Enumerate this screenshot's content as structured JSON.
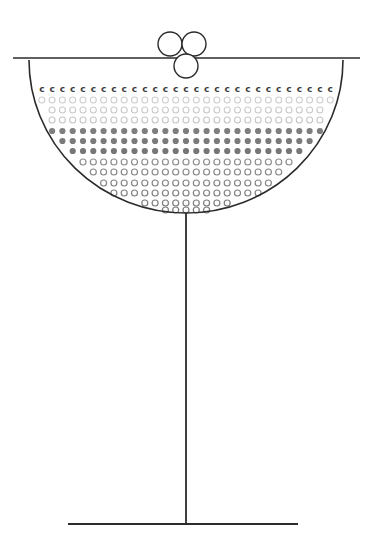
{
  "illustration": {
    "title": "Coupe Glass with Effervescence",
    "subject": "champagne-coupe-glass",
    "style": "line-art",
    "background_color": "#ffffff",
    "stroke_color": "#2b2b2b",
    "canvas": {
      "width": 372,
      "height": 548
    }
  },
  "geometry": {
    "rim": {
      "x1": 13,
      "y1": 58,
      "x2": 360,
      "y2": 58,
      "stroke_width": 1.4
    },
    "bowl": {
      "left_x": 29,
      "right_x": 343,
      "top_y": 60,
      "bottom_y": 213,
      "center_x": 186,
      "radius_x": 157,
      "radius_y": 153,
      "stroke_width": 1.6
    },
    "stem": {
      "x": 186,
      "y_top": 213,
      "y_bottom": 524,
      "stroke_width": 1.8
    },
    "base": {
      "x1": 68,
      "y1": 524,
      "x2": 298,
      "y2": 524,
      "stroke_width": 1.8
    }
  },
  "bubbles_large": {
    "label": "rising-bubble-cluster",
    "radius": 12,
    "stroke_color": "#2b2b2b",
    "stroke_width": 1.4,
    "items": [
      {
        "cx": 170,
        "cy": 44,
        "name": "bubble-top-left"
      },
      {
        "cx": 194,
        "cy": 44,
        "name": "bubble-top-right"
      },
      {
        "cx": 186,
        "cy": 66,
        "name": "bubble-lower-center"
      }
    ]
  },
  "fizz_rows": {
    "column_spacing": 10.3,
    "column_origin_x": 33,
    "column_count": 30,
    "rows": [
      {
        "y": 89,
        "kind": "glyph",
        "glyph": "c",
        "color": "#3c3c3c",
        "size": 9,
        "label": "crescent-row"
      },
      {
        "y": 100,
        "kind": "ring",
        "color": "#cfcfcf",
        "r": 3.0,
        "stroke_width": 1.1,
        "label": "pale-ring-row-1"
      },
      {
        "y": 110,
        "kind": "ring",
        "color": "#cbcbcb",
        "r": 3.0,
        "stroke_width": 1.1,
        "label": "pale-ring-row-2"
      },
      {
        "y": 120,
        "kind": "ring",
        "color": "#c6c6c6",
        "r": 3.0,
        "stroke_width": 1.1,
        "label": "pale-ring-row-3"
      },
      {
        "y": 131,
        "kind": "dot",
        "color": "#7e7e7e",
        "r": 3.1,
        "label": "dark-dot-row-1"
      },
      {
        "y": 141,
        "kind": "dot",
        "color": "#7a7a7a",
        "r": 3.1,
        "label": "dark-dot-row-2"
      },
      {
        "y": 151,
        "kind": "dot",
        "color": "#767676",
        "r": 3.1,
        "label": "dark-dot-row-3"
      },
      {
        "y": 162,
        "kind": "ring",
        "color": "#8e8e8e",
        "r": 3.0,
        "stroke_width": 1.2,
        "label": "mid-ring-row-1"
      },
      {
        "y": 172,
        "kind": "ring",
        "color": "#8a8a8a",
        "r": 3.0,
        "stroke_width": 1.2,
        "label": "mid-ring-row-2"
      },
      {
        "y": 183,
        "kind": "ring",
        "color": "#868686",
        "r": 3.0,
        "stroke_width": 1.2,
        "label": "mid-ring-row-3"
      },
      {
        "y": 193,
        "kind": "ring",
        "color": "#828282",
        "r": 3.0,
        "stroke_width": 1.2,
        "label": "mid-ring-row-4"
      },
      {
        "y": 203,
        "kind": "ring",
        "color": "#7e7e7e",
        "r": 3.0,
        "stroke_width": 1.2,
        "label": "mid-ring-row-5"
      },
      {
        "y": 210,
        "kind": "ring",
        "color": "#7a7a7a",
        "r": 3.0,
        "stroke_width": 1.2,
        "label": "mid-ring-row-6"
      }
    ]
  }
}
